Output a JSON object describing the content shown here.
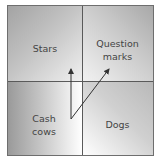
{
  "diagram": {
    "type": "2x2-matrix",
    "quadrants": {
      "top_left": {
        "label": "Stars"
      },
      "top_right": {
        "label_line1": "Question",
        "label_line2": "marks"
      },
      "bottom_left": {
        "label_line1": "Cash",
        "label_line2": "cows"
      },
      "bottom_right": {
        "label": "Dogs"
      }
    },
    "arrows": [
      {
        "from": "Cash cows",
        "to": "Stars",
        "direction": "up"
      },
      {
        "from": "Cash cows",
        "to": "Question marks",
        "direction": "diagonal-up-right"
      }
    ],
    "colors": {
      "border": "#6e6e6e",
      "divider": "#5a5a5a",
      "text": "#444444",
      "arrow": "#333333"
    }
  }
}
